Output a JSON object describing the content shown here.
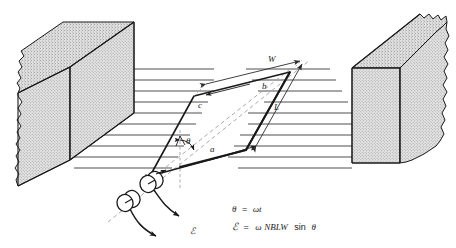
{
  "figure": {
    "type": "physics-diagram",
    "background_color": "#ffffff",
    "line_color": "#1a1a1a",
    "magnet_fill_color": "#d8d8d8",
    "field_line_color": "#3a3a3a",
    "dashed_color": "#9a9a9a"
  },
  "labels": {
    "side_a": "a",
    "side_b": "b",
    "side_c": "c",
    "side_d": "d",
    "width_dim": "W",
    "length_dim": "L",
    "angle": "θ",
    "emf": "ℰ"
  },
  "equations": {
    "line1_lhs": "θ",
    "line1_eq": "=",
    "line1_rhs": "ωt",
    "line1_full": "θ = ωt",
    "line2_lhs": "ℰ",
    "line2_eq": "=",
    "line2_rhs_omega": "ω",
    "line2_rhs_vars": "NBLW",
    "line2_rhs_fn": "sin",
    "line2_rhs_angle": "θ",
    "line2_full": "ℰ = ωNBLW sin θ"
  },
  "magnets": {
    "left": {
      "name": "left-pole-piece",
      "face_label": ""
    },
    "right": {
      "name": "right-pole-piece",
      "face_label": ""
    }
  },
  "field": {
    "left_line_count": 11,
    "right_line_count": 11,
    "direction": "left-to-right"
  },
  "slip_rings": {
    "count": 2,
    "brush_arrow_count": 2
  }
}
